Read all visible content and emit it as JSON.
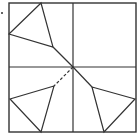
{
  "diagram": {
    "stroke_color": "#333333",
    "background": "#ffffff",
    "outer_square": {
      "x1": 9,
      "y1": 3,
      "x2": 136,
      "y2": 132
    },
    "center": {
      "x": 73,
      "y": 67
    },
    "marker_dot": {
      "x": 2,
      "y": 13
    },
    "triangles": [
      {
        "name": "upper-left-triangle",
        "points": "41,3 9,34 53,47"
      },
      {
        "name": "lower-left-triangle",
        "points": "54,86 10,99 41,132"
      },
      {
        "name": "lower-right-triangle",
        "points": "92,87 135,99 104,132"
      }
    ],
    "solid_segments": [
      {
        "name": "ul-triangle-to-center",
        "x1": 53,
        "y1": 47,
        "x2": 73,
        "y2": 67
      },
      {
        "name": "center-to-lr-triangle",
        "x1": 73,
        "y1": 67,
        "x2": 92,
        "y2": 87
      }
    ],
    "dashed_segments": [
      {
        "name": "center-to-ll-triangle",
        "x1": 73,
        "y1": 67,
        "x2": 54,
        "y2": 86
      }
    ]
  }
}
